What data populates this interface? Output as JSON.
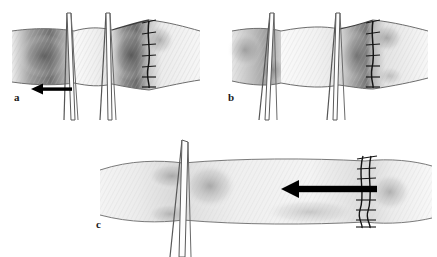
{
  "figure": {
    "background_color": "#ffffff",
    "width": 437,
    "height": 257,
    "ink_color": "#2b2b2b",
    "tissue_light": "#f2f2f2",
    "tissue_mid": "#c9c9c9",
    "tissue_dark": "#7a7a7a",
    "arrow_color": "#000000",
    "suture_color": "#1a1a1a"
  },
  "panels": [
    {
      "id": "a",
      "label": "a",
      "label_x": 14,
      "label_y": 99,
      "caption_letter": "a",
      "description": "Tubular structure held by two pairs of fine clamps; suture line at right end of the divided segment; arrow indicating traction to the left.",
      "arrow": {
        "present": true,
        "direction": "left",
        "x_start": 72,
        "x_end": 31,
        "y": 89,
        "shaft_thickness": 3.4,
        "head_length": 10,
        "head_width": 11,
        "color": "#000000"
      },
      "suture": {
        "present": true,
        "x": 148,
        "y_top": 21,
        "y_bottom": 88,
        "stitch_count": 7,
        "style": "interrupted-cross-stitch"
      },
      "clamps": [
        {
          "name": "clamp-pair-left",
          "x": 70,
          "top": 12,
          "bottom": 120
        },
        {
          "name": "clamp-pair-right",
          "x": 108,
          "top": 12,
          "bottom": 120
        }
      ],
      "tube": {
        "left": 12,
        "right": 200,
        "top": 30,
        "bottom": 82
      }
    },
    {
      "id": "b",
      "label": "b",
      "label_x": 228,
      "label_y": 99,
      "caption_letter": "b",
      "description": "Same construct after the suture line is drawn up; tissue cuff everted, clamps still in place, no traction arrow.",
      "arrow": {
        "present": false
      },
      "suture": {
        "present": true,
        "x": 372,
        "y_top": 21,
        "y_bottom": 86,
        "stitch_count": 7,
        "style": "interrupted-cross-stitch"
      },
      "clamps": [
        {
          "name": "clamp-pair-left",
          "x": 266,
          "top": 12,
          "bottom": 120
        },
        {
          "name": "clamp-pair-right",
          "x": 333,
          "top": 12,
          "bottom": 120
        }
      ],
      "tube": {
        "left": 232,
        "right": 428,
        "top": 30,
        "bottom": 82
      }
    },
    {
      "id": "c",
      "label": "c",
      "label_x": 96,
      "label_y": 226,
      "caption_letter": "c",
      "description": "Completed longer segment viewed with a single clamp at the left; running suture line at right with a bold arrow showing the direction of intussusception.",
      "arrow": {
        "present": true,
        "direction": "left",
        "x_start": 377,
        "x_end": 281,
        "y": 189,
        "shaft_thickness": 6.5,
        "head_length": 16,
        "head_width": 18,
        "color": "#000000"
      },
      "suture": {
        "present": true,
        "x": 308,
        "y_top": 157,
        "y_bottom": 222,
        "stitch_count": 8,
        "style": "double-strand-running"
      },
      "clamps": [
        {
          "name": "clamp-pair-single",
          "x": 183,
          "top": 140,
          "bottom": 250
        }
      ],
      "tube": {
        "left": 100,
        "right": 400,
        "top": 163,
        "bottom": 215
      }
    }
  ],
  "legend": {
    "arrow_meaning": "direction of traction / intussusception",
    "suture_meaning": "anastomotic suture line",
    "clamp_meaning": "fine approximating clamp"
  }
}
